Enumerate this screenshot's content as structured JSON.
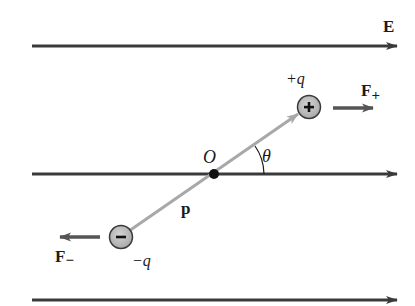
{
  "diagram": {
    "colors": {
      "field_line": "#3a3a3a",
      "dipole_vector": "#a8a8a8",
      "charge_fill": "#b8b8b8",
      "charge_stroke": "#3a3a3a",
      "force_arrow": "#555555",
      "text": "#1a1a1a"
    },
    "field": {
      "label": "E",
      "lines": [
        {
          "y": 46,
          "x1": 32,
          "x2": 397
        },
        {
          "y": 174,
          "x1": 32,
          "x2": 397
        },
        {
          "y": 300,
          "x1": 32,
          "x2": 397
        }
      ]
    },
    "origin": {
      "label": "O",
      "x": 214,
      "y": 174
    },
    "dipole_moment": {
      "label": "p"
    },
    "angle": {
      "label": "θ"
    },
    "positive_charge": {
      "symbol": "+",
      "label": "+q",
      "x": 309,
      "y": 107
    },
    "negative_charge": {
      "symbol": "−",
      "label": "−q",
      "x": 121,
      "y": 237
    },
    "force_positive": {
      "label": "F",
      "subscript": "+"
    },
    "force_negative": {
      "label": "F",
      "subscript": "−"
    }
  }
}
